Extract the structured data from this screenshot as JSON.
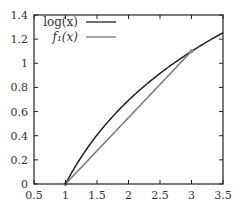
{
  "chart_data": {
    "type": "line",
    "title": "",
    "xlabel": "",
    "ylabel": "",
    "xlim": [
      0.5,
      3.5
    ],
    "ylim": [
      0,
      1.4
    ],
    "x_ticks": [
      "0.5",
      "1",
      "1.5",
      "2",
      "2.5",
      "3",
      "3.5"
    ],
    "y_ticks": [
      "0",
      "0.2",
      "0.4",
      "0.6",
      "0.8",
      "1",
      "1.2",
      "1.4"
    ],
    "grid": false,
    "legend_position": "top-left",
    "series": [
      {
        "name": "log(x)",
        "color": "#222222",
        "x": [
          1,
          1.25,
          1.5,
          1.75,
          2,
          2.25,
          2.5,
          2.75,
          3,
          3.25,
          3.5
        ],
        "values": [
          0,
          0.223,
          0.405,
          0.56,
          0.693,
          0.811,
          0.916,
          1.012,
          1.099,
          1.179,
          1.253
        ]
      },
      {
        "name": "f1(x)",
        "color": "#777777",
        "x": [
          1,
          3
        ],
        "values": [
          0,
          1.099
        ]
      }
    ],
    "markers": [
      {
        "x": 1,
        "y": 0
      },
      {
        "x": 3,
        "y": 1.099
      }
    ]
  },
  "legend": {
    "items": [
      {
        "label": "log(x)"
      },
      {
        "label": "f₁(x)"
      }
    ]
  }
}
